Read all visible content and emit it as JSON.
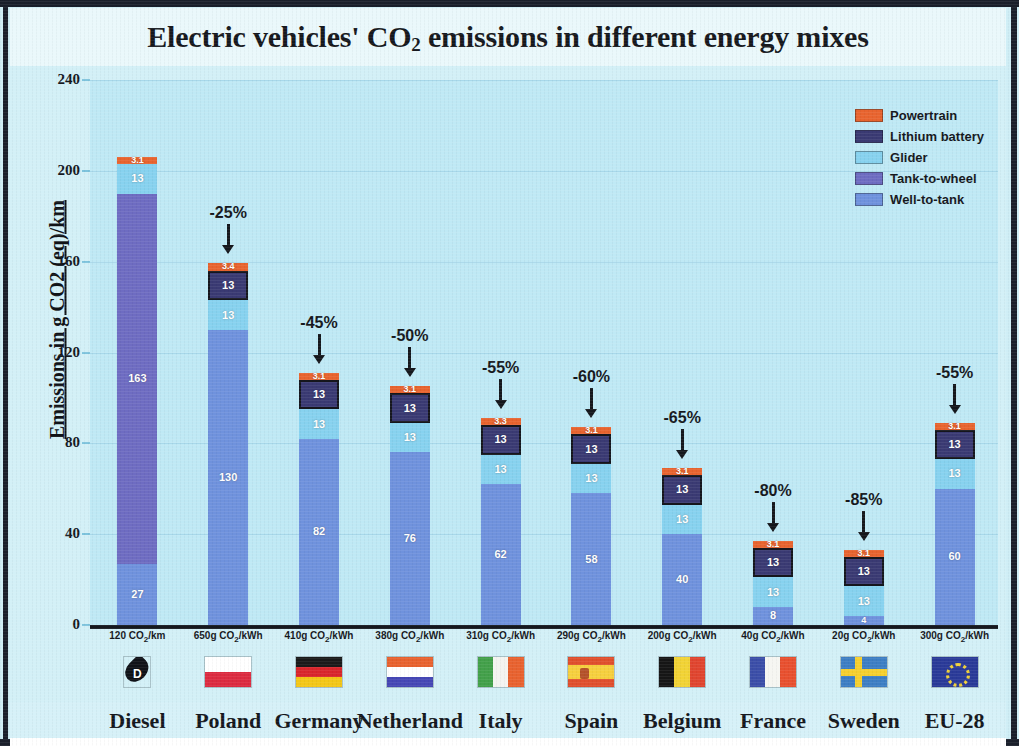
{
  "chart_data": {
    "type": "bar",
    "subtype": "stacked-bar",
    "title": "Electric vehicles' CO2 emissions in different energy mixes",
    "title_parts": {
      "pre": "Electric vehicles' CO",
      "sub": "2",
      "post": " emissions in different energy mixes"
    },
    "ylabel": "Emissions in g CO2 (eq)/km",
    "xlabel": "",
    "ylim": [
      0,
      240
    ],
    "yticks": [
      0,
      40,
      80,
      120,
      160,
      200,
      240
    ],
    "grid": true,
    "legend_position": "top-right",
    "categories": [
      "Diesel",
      "Poland",
      "Germany",
      "Netherland",
      "Italy",
      "Spain",
      "Belgium",
      "France",
      "Sweden",
      "EU-28"
    ],
    "category_sublabels": [
      "120 CO2/km",
      "650g CO2/kWh",
      "410g CO2/kWh",
      "380g CO2/kWh",
      "310g CO2/kWh",
      "290g CO2/kWh",
      "200g CO2/kWh",
      "40g CO2/kWh",
      "20g CO2/kWh",
      "300g CO2/kWh"
    ],
    "series": [
      {
        "name": "Well-to-tank",
        "color": "#6f92dd",
        "values": [
          27,
          130,
          82,
          76,
          62,
          58,
          40,
          8,
          4,
          60
        ]
      },
      {
        "name": "Tank-to-wheel",
        "color": "#6e6cc2",
        "values": [
          163,
          0,
          0,
          0,
          0,
          0,
          0,
          0,
          0,
          0
        ]
      },
      {
        "name": "Glider",
        "color": "#87d2ef",
        "values": [
          13,
          13,
          13,
          13,
          13,
          13,
          13,
          13,
          13,
          13
        ]
      },
      {
        "name": "Lithium battery",
        "color": "#3a3a73",
        "values": [
          0,
          13,
          13,
          13,
          13,
          13,
          13,
          13,
          13,
          13
        ]
      },
      {
        "name": "Powertrain",
        "color": "#e8642f",
        "values": [
          3.1,
          3.4,
          3.1,
          3.1,
          3.3,
          3.1,
          3.1,
          3.1,
          3.1,
          3.1
        ]
      }
    ],
    "totals": [
      206.1,
      159.4,
      111.1,
      105.1,
      91.3,
      87.1,
      69.1,
      37.1,
      33.1,
      89.1
    ],
    "annotations": [
      {
        "category": "Poland",
        "text": "-25%"
      },
      {
        "category": "Germany",
        "text": "-45%"
      },
      {
        "category": "Netherland",
        "text": "-50%"
      },
      {
        "category": "Italy",
        "text": "-55%"
      },
      {
        "category": "Spain",
        "text": "-60%"
      },
      {
        "category": "Belgium",
        "text": "-65%"
      },
      {
        "category": "France",
        "text": "-80%"
      },
      {
        "category": "Sweden",
        "text": "-85%"
      },
      {
        "category": "EU-28",
        "text": "-55%"
      }
    ],
    "flags": [
      {
        "category": "Diesel",
        "icon": "diesel-drop-icon",
        "letter": "D"
      },
      {
        "category": "Poland",
        "icon": "flag-poland-icon"
      },
      {
        "category": "Germany",
        "icon": "flag-germany-icon"
      },
      {
        "category": "Netherland",
        "icon": "flag-netherlands-icon"
      },
      {
        "category": "Italy",
        "icon": "flag-italy-icon"
      },
      {
        "category": "Spain",
        "icon": "flag-spain-icon"
      },
      {
        "category": "Belgium",
        "icon": "flag-belgium-icon"
      },
      {
        "category": "France",
        "icon": "flag-france-icon"
      },
      {
        "category": "Sweden",
        "icon": "flag-sweden-icon"
      },
      {
        "category": "EU-28",
        "icon": "flag-eu-icon"
      }
    ],
    "colors": {
      "plot_background": "#bfe9f5",
      "page_background": "#d3f0f7",
      "gridline": "#a8d8ea",
      "axis": "#14181f"
    }
  }
}
